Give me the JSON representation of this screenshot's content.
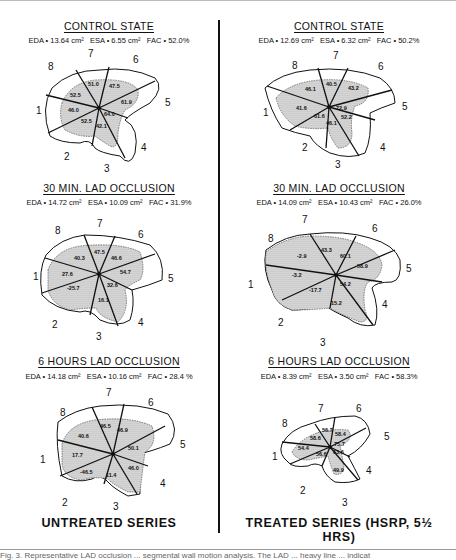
{
  "figure": {
    "columns": [
      {
        "series_label": "UNTREATED SERIES",
        "panels": [
          {
            "title": "CONTROL STATE",
            "eda": "EDA • 13.64 cm²",
            "esa": "ESA • 6.55 cm²",
            "fac": "FAC • 52.0%",
            "segment_values": {
              "8": "52.5",
              "7": "51.0",
              "6": "47.5",
              "5": "61.9",
              "4": "64.0",
              "3": "42.1",
              "2": "52.5",
              "1": "46.0"
            }
          },
          {
            "title": "30 MIN. LAD OCCLUSION",
            "eda": "EDA • 14.72 cm²",
            "esa": "ESA • 10.09 cm²",
            "fac": "FAC • 31.9%",
            "segment_values": {
              "8": "40.3",
              "7": "47.5",
              "6": "46.6",
              "5": "54.7",
              "4": "32.6",
              "3": "16.1",
              "2": "-25.7",
              "1": "27.6"
            }
          },
          {
            "title": "6 HOURS LAD OCCLUSION",
            "eda": "EDA • 14.18 cm²",
            "esa": "ESA • 10.16 cm²",
            "fac": "FAC • 28.4 %",
            "segment_values": {
              "8": "40.6",
              "7": "46.5",
              "6": "46.9",
              "5": "50.1",
              "4": "46.0",
              "3": "11.4",
              "2": "-46.5",
              "1": "17.7"
            }
          }
        ]
      },
      {
        "series_label": "TREATED SERIES (HSRP, 5½ HRS)",
        "panels": [
          {
            "title": "CONTROL STATE",
            "eda": "EDA • 12.69 cm²",
            "esa": "ESA • 6.32 cm²",
            "fac": "FAC • 50.2%",
            "segment_values": {
              "8": "46.1",
              "7": "40.5",
              "6": "43.2",
              "5": "72.9",
              "4": "52.2",
              "3": "46.1",
              "2": "61.6",
              "1": "41.6"
            }
          },
          {
            "title": "30 MIN. LAD OCCLUSION",
            "eda": "EDA • 14.09 cm²",
            "esa": "ESA • 10.43 cm²",
            "fac": "FAC • 26.0%",
            "segment_values": {
              "8": "-2.9",
              "7": "43.3",
              "6": "60.1",
              "5": "58.9",
              "4": "54.2",
              "3": "15.2",
              "2": "-17.7",
              "1": "-3.2"
            }
          },
          {
            "title": "6 HOURS LAD OCCLUSION",
            "eda": "EDA • 8.39 cm²",
            "esa": "ESA • 3.50 cm²",
            "fac": "FAC • 58.3%",
            "segment_values": {
              "8": "58.6",
              "7": "56.7",
              "6": "58.4",
              "5": "75.7",
              "4": "63.6",
              "3": "49.9",
              "2": "56.6",
              "1": "54.4"
            }
          }
        ]
      }
    ],
    "segment_numbers": [
      "1",
      "2",
      "3",
      "4",
      "5",
      "6",
      "7",
      "8"
    ],
    "caption_partial": "Fig. 3. Representative LAD occlusion ... segmental wall motion analysis. The LAD ... heavy line ... indicat"
  }
}
